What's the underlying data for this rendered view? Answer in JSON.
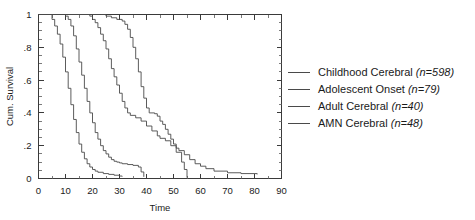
{
  "chart_data": {
    "type": "line",
    "title": "",
    "subtitle": "",
    "xlabel": "Time",
    "ylabel": "Cum. Survival",
    "xlim": [
      0,
      90
    ],
    "ylim": [
      0,
      1
    ],
    "xticks": [
      0,
      10,
      20,
      30,
      40,
      50,
      60,
      70,
      80,
      90
    ],
    "xtick_labels": [
      "0",
      "10",
      "20",
      "30",
      "40",
      "50",
      "60",
      "70",
      "80",
      "90"
    ],
    "xminor_step": 5,
    "yticks": [
      0,
      0.2,
      0.4,
      0.6,
      0.8,
      1
    ],
    "ytick_labels": [
      "0",
      ".2",
      ".4",
      ".6",
      ".8",
      "1"
    ],
    "yminor_step": 0.05,
    "grid": false,
    "legend_position": "right",
    "step_style": "post",
    "series": [
      {
        "name": "Childhood Cerebral",
        "n": 598,
        "label": "Childhood Cerebral",
        "n_label": "(n=598)",
        "color": "#4a4a4a",
        "x": [
          0,
          4,
          5,
          6,
          7,
          8,
          9,
          10,
          11,
          12,
          13,
          14,
          15,
          16,
          17,
          18,
          19,
          20,
          21,
          22,
          24,
          26,
          28,
          30,
          31
        ],
        "y": [
          1,
          1,
          0.97,
          0.93,
          0.88,
          0.82,
          0.74,
          0.65,
          0.55,
          0.45,
          0.36,
          0.28,
          0.21,
          0.16,
          0.12,
          0.09,
          0.07,
          0.055,
          0.045,
          0.038,
          0.03,
          0.025,
          0.02,
          0.015,
          0.012
        ]
      },
      {
        "name": "Adolescent Onset",
        "n": 79,
        "label": "Adolescent Onset",
        "n_label": "(n=79)",
        "color": "#4a4a4a",
        "x": [
          0,
          9,
          10,
          11,
          12,
          13,
          14,
          15,
          16,
          17,
          18,
          19,
          20,
          21,
          22,
          23,
          24,
          25,
          26,
          27,
          28,
          29,
          30,
          31,
          33,
          35,
          37,
          38,
          39
        ],
        "y": [
          1,
          1,
          0.99,
          0.97,
          0.93,
          0.87,
          0.79,
          0.71,
          0.63,
          0.55,
          0.47,
          0.4,
          0.34,
          0.28,
          0.24,
          0.2,
          0.17,
          0.15,
          0.13,
          0.115,
          0.105,
          0.1,
          0.095,
          0.09,
          0.085,
          0.08,
          0.07,
          0.04,
          0.01
        ]
      },
      {
        "name": "Adult Cerebral",
        "n": 40,
        "label": "Adult Cerebral",
        "n_label": "(n=40)",
        "color": "#4a4a4a",
        "x": [
          0,
          18,
          19,
          20,
          21,
          22,
          23,
          24,
          25,
          26,
          27,
          28,
          29,
          30,
          31,
          32,
          33,
          34,
          36,
          38,
          40,
          42,
          44,
          45,
          47,
          49,
          51,
          53,
          54,
          55
        ],
        "y": [
          1,
          1,
          0.99,
          0.97,
          0.95,
          0.92,
          0.88,
          0.84,
          0.79,
          0.73,
          0.67,
          0.62,
          0.57,
          0.52,
          0.47,
          0.43,
          0.4,
          0.385,
          0.37,
          0.35,
          0.32,
          0.29,
          0.26,
          0.245,
          0.23,
          0.2,
          0.16,
          0.1,
          0.055,
          0.005
        ]
      },
      {
        "name": "AMN Cerebral",
        "n": 48,
        "label": "AMN Cerebral",
        "n_label": "(n=48)",
        "color": "#4a4a4a",
        "x": [
          0,
          23,
          25,
          27,
          29,
          31,
          32,
          33,
          34,
          35,
          36,
          37,
          38,
          39,
          40,
          41,
          43,
          44,
          45,
          46,
          47,
          48,
          49,
          50,
          51,
          52,
          54,
          56,
          58,
          60,
          62,
          65,
          70,
          75,
          81
        ],
        "y": [
          1,
          1,
          0.99,
          0.98,
          0.97,
          0.96,
          0.94,
          0.91,
          0.86,
          0.8,
          0.73,
          0.65,
          0.56,
          0.49,
          0.43,
          0.4,
          0.395,
          0.38,
          0.35,
          0.33,
          0.3,
          0.27,
          0.24,
          0.21,
          0.185,
          0.17,
          0.145,
          0.115,
          0.09,
          0.075,
          0.06,
          0.045,
          0.035,
          0.03,
          0.025
        ]
      }
    ]
  },
  "legend": {
    "entries": [
      {
        "label": "Childhood Cerebral",
        "n_label": "(n=598)"
      },
      {
        "label": "Adolescent Onset",
        "n_label": "(n=79)"
      },
      {
        "label": "Adult Cerebral",
        "n_label": "(n=40)"
      },
      {
        "label": "AMN Cerebral",
        "n_label": "(n=48)"
      }
    ]
  }
}
